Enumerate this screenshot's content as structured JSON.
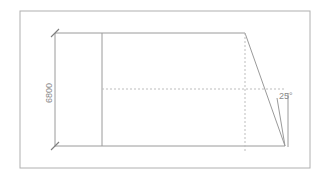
{
  "drawing": {
    "title": "CAD elevation sketch",
    "background_color": "#ffffff",
    "border": {
      "name": "sheet-border",
      "x": 20,
      "y": 11,
      "width": 290,
      "height": 157,
      "color": "#b0b0b0",
      "stroke_width": 1
    },
    "colors": {
      "solid_line": "#9a9a9a",
      "dashed_line": "#bdbdbd",
      "dimension_line": "#9a9a9a",
      "text": "#8a8a8a",
      "border": "#b0b0b0"
    },
    "shape": {
      "name": "trapezoid-outline",
      "description": "Quadrilateral elevation with slanted right edge",
      "points": "102,33 245,33 285,146 102,146",
      "stroke_width": 1
    },
    "dimension": {
      "name": "height-dimension",
      "label": "6800",
      "unit": "mm",
      "orientation": "vertical",
      "text_rotation": -90,
      "line_x": 55,
      "top_y": 33,
      "bottom_y": 146,
      "extension_top": {
        "x1": 55,
        "y1": 33,
        "x2": 102,
        "y2": 33
      },
      "extension_bottom": {
        "x1": 55,
        "y1": 146,
        "x2": 102,
        "y2": 146
      },
      "tick_style": "oblique-slash",
      "text_x": 50,
      "text_y": 93,
      "font_size": 9
    },
    "angle": {
      "name": "slope-angle",
      "label": "25°",
      "value": 25,
      "text_x": 279,
      "text_y": 97,
      "font_size": 9,
      "reference_line": {
        "x1": 288,
        "y1": 93,
        "x2": 288,
        "y2": 147
      },
      "leader_line": {
        "x1": 277,
        "y1": 98,
        "x2": 285,
        "y2": 146
      }
    },
    "center_lines": [
      {
        "name": "horizontal-centerline",
        "orientation": "horizontal",
        "x1": 102,
        "y1": 89,
        "x2": 284,
        "y2": 89,
        "dash": "2,2"
      },
      {
        "name": "vertical-centerline",
        "orientation": "vertical",
        "x1": 245,
        "y1": 33,
        "x2": 245,
        "y2": 152,
        "dash": "2,2"
      }
    ]
  }
}
